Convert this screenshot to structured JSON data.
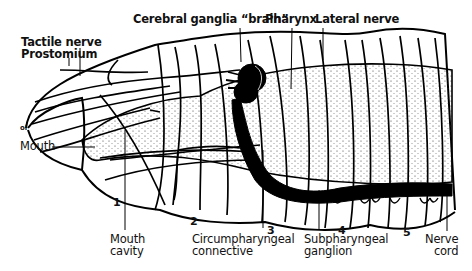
{
  "diagram": {
    "labels": {
      "cerebral_ganglia": "Cerebral ganglia “brain”",
      "pharynx": "Pharynx",
      "lateral_nerve": "Lateral nerve",
      "tactile_nerve": "Tactile nerve",
      "prostomium": "Prostomium",
      "mouth": "Mouth",
      "mouth_cavity_line1": "Mouth",
      "mouth_cavity_line2": "cavity",
      "circumpharyngeal_line1": "Circumpharyngeal",
      "circumpharyngeal_line2": "connective",
      "subpharyngeal_line1": "Subpharyngeal",
      "subpharyngeal_line2": "ganglion",
      "nerve_cord_line1": "Nerve",
      "nerve_cord_line2": "cord",
      "tip_mark": "ol"
    },
    "segments": [
      "1",
      "2",
      "3",
      "4",
      "5"
    ],
    "colors": {
      "ink": "#000000",
      "background": "#ffffff",
      "stipple": "#444444"
    }
  }
}
